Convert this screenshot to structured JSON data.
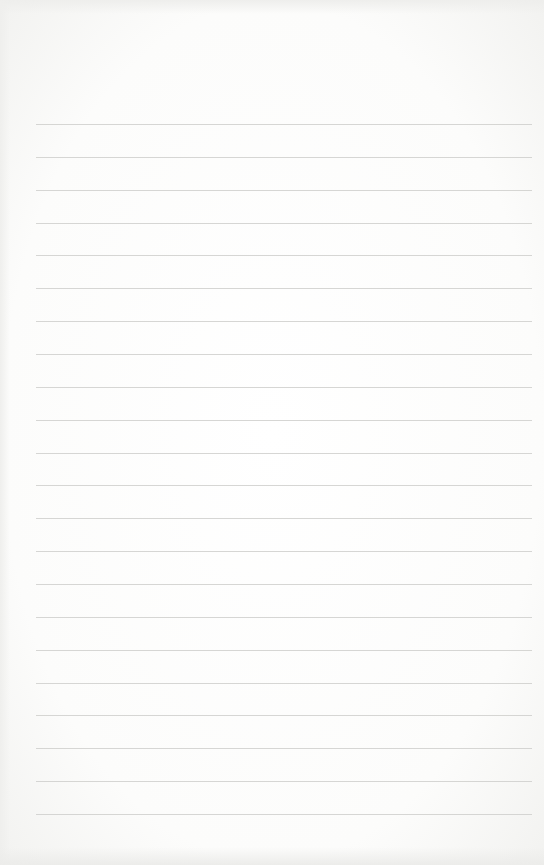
{
  "page": {
    "type": "blank lined paper",
    "background_color": "#fbfbfa",
    "rule_color": "#cfcfcd",
    "rule_count": 22,
    "first_rule_y": 124,
    "rule_spacing": 32.86,
    "rule_left": 36,
    "rule_width": 496
  }
}
